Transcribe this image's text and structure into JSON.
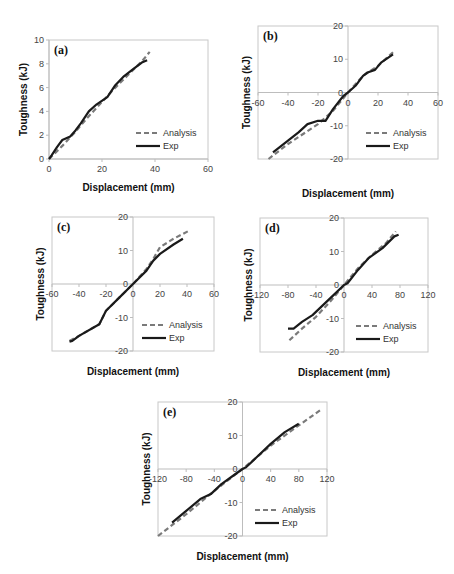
{
  "figure": {
    "top_cut_text": "",
    "colors": {
      "analysis": "#7a7a7a",
      "exp": "#1a1a1a",
      "frame": "#c8c8c8",
      "axis": "#bdbdbd"
    }
  },
  "chart_data": [
    {
      "id": "a",
      "type": "line",
      "panel_label": "(a)",
      "xlabel": "Displacement (mm)",
      "ylabel": "Toughness (kJ)",
      "xlim": [
        0,
        60
      ],
      "ylim": [
        0,
        10
      ],
      "xticks": [
        0,
        20,
        40,
        60
      ],
      "yticks": [
        0,
        2,
        4,
        6,
        8,
        10
      ],
      "grid": false,
      "legend": {
        "entries": [
          "Analysis",
          "Exp"
        ],
        "position": "lower right"
      },
      "frame": {
        "left": 49,
        "top": 40,
        "right": 208,
        "bottom": 159
      },
      "series": [
        {
          "name": "Analysis",
          "style": "dashed",
          "x": [
            0,
            5,
            10,
            15,
            20,
            25,
            30,
            35,
            38
          ],
          "y": [
            0,
            1.1,
            2.3,
            3.6,
            4.8,
            6.0,
            7.1,
            8.2,
            9.0
          ]
        },
        {
          "name": "Exp",
          "style": "solid",
          "x": [
            0,
            1,
            3,
            5,
            8,
            10,
            12,
            15,
            18,
            22,
            25,
            28,
            32,
            35,
            37
          ],
          "y": [
            0,
            0.3,
            1.0,
            1.6,
            1.9,
            2.4,
            3.0,
            4.0,
            4.6,
            5.2,
            6.2,
            6.9,
            7.6,
            8.1,
            8.3
          ]
        }
      ]
    },
    {
      "id": "b",
      "type": "line",
      "panel_label": "(b)",
      "xlabel": "Displacement (mm)",
      "ylabel": "Toughness (kJ)",
      "xlim": [
        -60,
        60
      ],
      "ylim": [
        -20,
        20
      ],
      "xticks": [
        -60,
        -40,
        -20,
        0,
        20,
        40,
        60
      ],
      "yticks": [
        -20,
        -10,
        0,
        10,
        20
      ],
      "grid": false,
      "legend": {
        "entries": [
          "Analysis",
          "Exp"
        ],
        "position": "lower right"
      },
      "frame": {
        "left": 258,
        "top": 26,
        "right": 438,
        "bottom": 159
      },
      "series": [
        {
          "name": "Analysis",
          "style": "dashed",
          "x": [
            -53,
            -40,
            -20,
            -10,
            0,
            10,
            20,
            31
          ],
          "y": [
            -20,
            -15.5,
            -9.5,
            -5.5,
            0,
            5,
            8,
            12.5
          ]
        },
        {
          "name": "Exp",
          "style": "solid",
          "x": [
            -50,
            -40,
            -33,
            -27,
            -20,
            -15,
            -10,
            -3,
            0,
            5,
            10,
            13,
            18,
            22,
            30
          ],
          "y": [
            -18,
            -14.5,
            -12,
            -9.5,
            -8.5,
            -8.5,
            -5,
            -1,
            0,
            2,
            5,
            6,
            6.8,
            9,
            11.5
          ]
        }
      ]
    },
    {
      "id": "c",
      "type": "line",
      "panel_label": "(c)",
      "xlabel": "Displacement (mm)",
      "ylabel": "Toughness (kJ)",
      "xlim": [
        -60,
        60
      ],
      "ylim": [
        -20,
        20
      ],
      "xticks": [
        -60,
        -40,
        -20,
        0,
        20,
        40,
        60
      ],
      "yticks": [
        -20,
        -10,
        0,
        10,
        20
      ],
      "grid": false,
      "legend": {
        "entries": [
          "Analysis",
          "Exp"
        ],
        "position": "lower right"
      },
      "frame": {
        "left": 52,
        "top": 217,
        "right": 214,
        "bottom": 351
      },
      "series": [
        {
          "name": "Analysis",
          "style": "dashed",
          "x": [
            -47,
            -40,
            -25,
            -20,
            -10,
            0,
            10,
            15,
            20,
            30,
            41
          ],
          "y": [
            -17,
            -15.5,
            -12,
            -8,
            -4,
            0,
            4.5,
            7.5,
            11,
            13.5,
            15.8
          ]
        },
        {
          "name": "Exp",
          "style": "solid",
          "x": [
            -47,
            -45,
            -40,
            -25,
            -20,
            -10,
            0,
            10,
            15,
            20,
            30,
            37
          ],
          "y": [
            -17.2,
            -17,
            -15.5,
            -12,
            -8,
            -4,
            0,
            4,
            7,
            9,
            11.8,
            13.5
          ]
        }
      ]
    },
    {
      "id": "d",
      "type": "line",
      "panel_label": "(d)",
      "xlabel": "Displacement (mm)",
      "ylabel": "Toughness (kJ)",
      "xlim": [
        -120,
        120
      ],
      "ylim": [
        -20,
        20
      ],
      "xticks": [
        -120,
        -80,
        -40,
        0,
        40,
        80,
        120
      ],
      "yticks": [
        -20,
        -10,
        0,
        10,
        20
      ],
      "grid": false,
      "legend": {
        "entries": [
          "Analysis",
          "Exp"
        ],
        "position": "lower right"
      },
      "frame": {
        "left": 260,
        "top": 218,
        "right": 428,
        "bottom": 352
      },
      "series": [
        {
          "name": "Analysis",
          "style": "dashed",
          "x": [
            -78,
            -60,
            -40,
            -20,
            0,
            20,
            40,
            60,
            74
          ],
          "y": [
            -16.5,
            -13,
            -9.5,
            -5,
            0,
            5,
            9,
            12.5,
            16
          ]
        },
        {
          "name": "Exp",
          "style": "solid",
          "x": [
            -80,
            -72,
            -60,
            -45,
            -30,
            -15,
            0,
            5,
            20,
            35,
            55,
            72,
            78
          ],
          "y": [
            -13,
            -13,
            -11,
            -9,
            -6,
            -3,
            0,
            0.5,
            4.5,
            8,
            11,
            14.5,
            15
          ]
        }
      ]
    },
    {
      "id": "e",
      "type": "line",
      "panel_label": "(e)",
      "xlabel": "Displacement (mm)",
      "ylabel": "Toughness (kJ)",
      "xlim": [
        -120,
        120
      ],
      "ylim": [
        -20,
        20
      ],
      "xticks": [
        -120,
        -80,
        -40,
        0,
        40,
        80,
        120
      ],
      "yticks": [
        -20,
        -10,
        0,
        10,
        20
      ],
      "grid": false,
      "legend": {
        "entries": [
          "Analysis",
          "Exp"
        ],
        "position": "lower right"
      },
      "frame": {
        "left": 158,
        "top": 402,
        "right": 327,
        "bottom": 536
      },
      "series": [
        {
          "name": "Analysis",
          "style": "dashed",
          "x": [
            -120,
            -80,
            -40,
            0,
            40,
            80,
            110
          ],
          "y": [
            -20,
            -13.5,
            -6.5,
            0,
            7,
            13,
            17.5
          ]
        },
        {
          "name": "Exp",
          "style": "solid",
          "x": [
            -100,
            -80,
            -60,
            -45,
            -30,
            -10,
            0,
            5,
            20,
            40,
            60,
            80
          ],
          "y": [
            -16,
            -12.5,
            -9,
            -7.5,
            -4.5,
            -1.5,
            0,
            0.5,
            3.5,
            7.5,
            11,
            13.5
          ]
        }
      ]
    }
  ]
}
